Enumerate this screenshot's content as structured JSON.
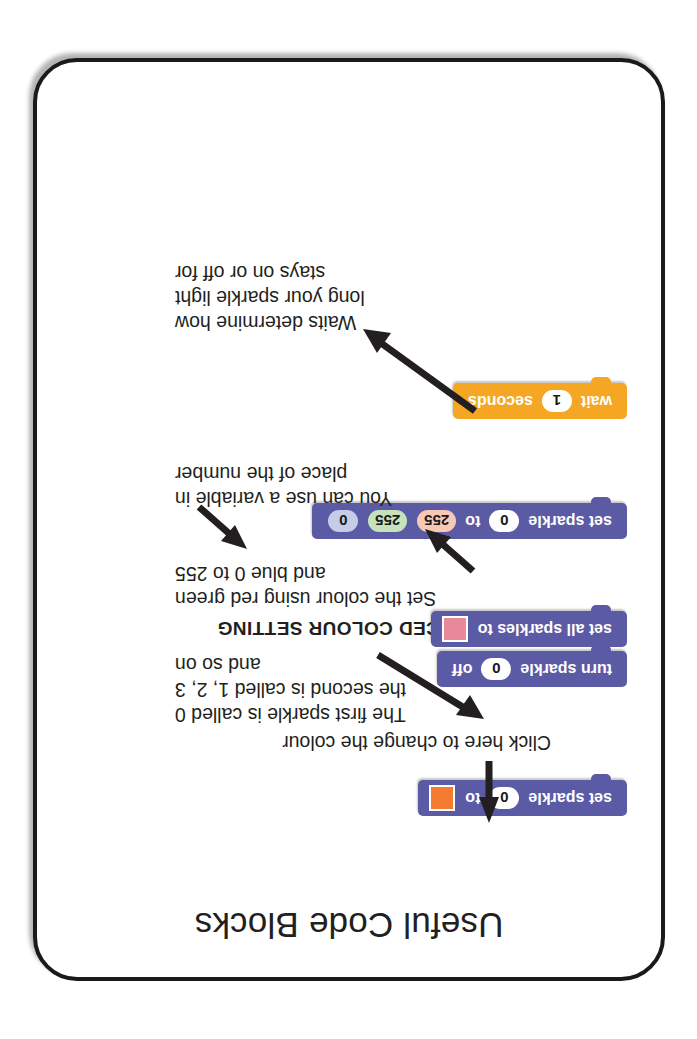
{
  "card": {
    "title": "Useful Code Blocks",
    "orientation": "upside-down"
  },
  "annotations": {
    "click_colour": "Click here to change the colour",
    "sparkle_index_line1": "The first sparkle is called 0",
    "sparkle_index_line2": "the second is called 1, 2, 3",
    "sparkle_index_line3": "and so on",
    "advanced_heading": "ADVANCED COLOUR SETTING",
    "advanced_line1": "Set the colour using red green",
    "advanced_line2": "and blue 0 to 255",
    "variable_line1": "You can use a variable in",
    "variable_line2": "place of the number",
    "wait_line1": "Waits determine how",
    "wait_line2": "long your sparkle light",
    "wait_line3": "stays on or off for"
  },
  "blocks": {
    "set_sparkle_colour": {
      "prefix": "set sparkle",
      "index": "0",
      "middle": "to",
      "swatch_color": "#f47b30"
    },
    "turn_sparkle_off": {
      "prefix": "turn sparkle",
      "index": "0",
      "suffix": "off"
    },
    "set_all_sparkles": {
      "prefix": "set all sparkles to",
      "swatch_color": "#e8899a"
    },
    "set_sparkle_rgb": {
      "prefix": "set sparkle",
      "index": "0",
      "middle": "to",
      "red": "255",
      "green": "255",
      "blue": "0"
    },
    "wait_seconds": {
      "prefix": "wait",
      "value": "1",
      "suffix": "seconds"
    }
  },
  "colors": {
    "block_purple": "#5b5ba5",
    "block_orange": "#f5a623",
    "card_border": "#1a1a1a",
    "text": "#231f20",
    "field_red": "#f9c8b5",
    "field_green": "#c5e2bd",
    "field_blue": "#c6cbe8"
  }
}
